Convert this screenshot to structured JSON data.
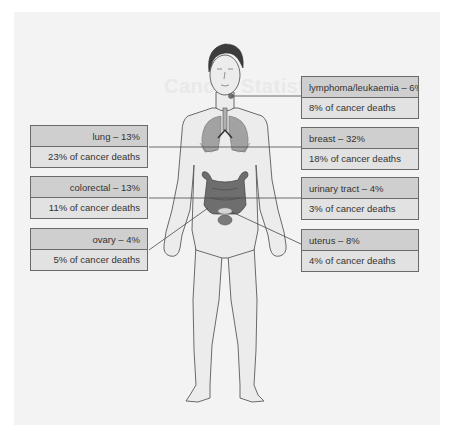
{
  "background_ghost_text": "Cancer Statistics",
  "labels": {
    "left": [
      {
        "site": "lung – 13%",
        "deaths": "23% of cancer deaths"
      },
      {
        "site": "colorectal – 13%",
        "deaths": "11% of cancer deaths"
      },
      {
        "site": "ovary – 4%",
        "deaths": "5% of cancer deaths"
      }
    ],
    "right": [
      {
        "site": "lymphoma/leukaemia – 6%",
        "deaths": "8% of cancer deaths"
      },
      {
        "site": "breast – 32%",
        "deaths": "18% of cancer deaths"
      },
      {
        "site": "urinary tract – 4%",
        "deaths": "3% of cancer deaths"
      },
      {
        "site": "uterus – 8%",
        "deaths": "4% of cancer deaths"
      }
    ]
  },
  "colors": {
    "panel_bg": "#f3f3f3",
    "box_top": "#cfcfcf",
    "box_bottom": "#e2e2e2",
    "organ": "#6e6e6e",
    "skin": "#ececec",
    "outline": "#555555"
  }
}
